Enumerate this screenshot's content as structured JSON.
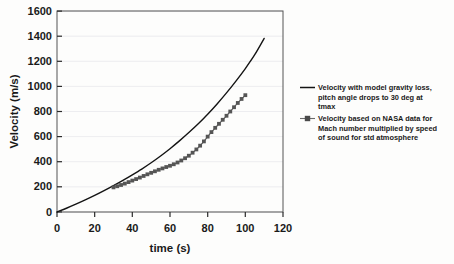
{
  "chart_data": {
    "type": "line",
    "title": "",
    "xlabel": "time  (s)",
    "ylabel": "Velocity (m/s)",
    "xlim": [
      0,
      120
    ],
    "ylim": [
      0,
      1600
    ],
    "xticks": [
      0,
      20,
      40,
      60,
      80,
      100,
      120
    ],
    "yticks": [
      0,
      200,
      400,
      600,
      800,
      1000,
      1200,
      1400,
      1600
    ],
    "xtick_labels": [
      "0",
      "20",
      "40",
      "60",
      "80",
      "100",
      "120"
    ],
    "ytick_labels": [
      "0",
      "200",
      "400",
      "600",
      "800",
      "1000",
      "1200",
      "1400",
      "1600"
    ],
    "grid": "horizontal",
    "legend_position": "right",
    "series": [
      {
        "name": "Velocity with model gravity loss, pitch angle drops to 30 deg at tmax",
        "style": "solid-line",
        "color": "#141414",
        "marker": "none",
        "x": [
          0,
          5,
          10,
          15,
          20,
          25,
          30,
          35,
          40,
          45,
          50,
          55,
          60,
          65,
          70,
          75,
          80,
          85,
          90,
          95,
          100,
          105,
          110
        ],
        "y": [
          0,
          30,
          62,
          96,
          132,
          170,
          210,
          252,
          296,
          342,
          392,
          446,
          504,
          566,
          632,
          702,
          778,
          860,
          948,
          1042,
          1142,
          1252,
          1382
        ]
      },
      {
        "name": "Velocity based on NASA data for Mach number multiplied by speed of sound for std atmosphere",
        "style": "line-with-square-markers",
        "color": "#555555",
        "marker": "square",
        "x": [
          30,
          32,
          34,
          36,
          38,
          40,
          42,
          44,
          46,
          48,
          50,
          52,
          54,
          56,
          58,
          60,
          62,
          64,
          66,
          68,
          70,
          72,
          74,
          76,
          78,
          80,
          82,
          84,
          86,
          88,
          90,
          92,
          94,
          96,
          98,
          100
        ],
        "y": [
          196,
          205,
          215,
          226,
          238,
          250,
          262,
          274,
          287,
          300,
          312,
          324,
          336,
          347,
          358,
          368,
          380,
          394,
          410,
          428,
          448,
          472,
          498,
          528,
          562,
          600,
          636,
          670,
          702,
          734,
          766,
          800,
          834,
          868,
          900,
          930
        ]
      }
    ],
    "legend_entries": [
      {
        "id": "legend-entry-model",
        "lines": [
          "Velocity with model gravity loss,",
          "pitch angle drops to 30 deg at",
          "tmax"
        ],
        "marker": "line",
        "color": "#141414"
      },
      {
        "id": "legend-entry-nasa",
        "lines": [
          "Velocity based on NASA data for",
          "Mach number multiplied by speed",
          "of sound for std atmosphere"
        ],
        "marker": "line-square",
        "color": "#6b6b6b"
      }
    ]
  }
}
